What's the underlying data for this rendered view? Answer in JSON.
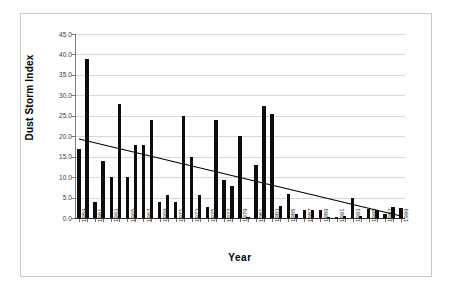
{
  "chart_data": {
    "type": "bar",
    "title": "",
    "xlabel": "Year",
    "ylabel": "Dust Storm Index",
    "ylim": [
      0,
      45
    ],
    "ytick_step": 5,
    "ytick_labels": [
      "0.0",
      "5.0",
      "10.0",
      "15.0",
      "20.0",
      "25.0",
      "30.0",
      "35.0",
      "40.0",
      "45.0"
    ],
    "grid": true,
    "legend": "none",
    "bar_color": "#0d0d0d",
    "categories": [
      "1959",
      "1960",
      "1961",
      "1962",
      "1963",
      "1964",
      "1965",
      "1966",
      "1967",
      "1968",
      "1969",
      "1970",
      "1971",
      "1972",
      "1973",
      "1974",
      "1975",
      "1976",
      "1977",
      "1978",
      "1979",
      "1980",
      "1981",
      "1982",
      "1983",
      "1984",
      "1985",
      "1986",
      "1987",
      "1988",
      "1989",
      "1990",
      "1991",
      "1992",
      "1993",
      "1994",
      "1995",
      "1996",
      "1997",
      "1998",
      "1999"
    ],
    "xtick_labels_shown": [
      "1959",
      "1961",
      "1963",
      "1965",
      "1967",
      "1969",
      "1971",
      "1973",
      "1975",
      "1977",
      "1979",
      "1981",
      "1983",
      "1985",
      "1987",
      "1989",
      "1991",
      "1993",
      "1995",
      "1997",
      "1999"
    ],
    "values": [
      16.8,
      39.0,
      3.9,
      13.9,
      10.0,
      28.0,
      10.0,
      17.9,
      17.9,
      24.0,
      4.0,
      5.7,
      3.8,
      25.0,
      14.9,
      5.7,
      2.8,
      24.0,
      9.2,
      7.8,
      20.0,
      0.2,
      13.0,
      27.3,
      25.4,
      3.0,
      5.9,
      1.1,
      1.9,
      1.9,
      1.9,
      0.2,
      0.0,
      0.5,
      4.9,
      0.5,
      2.1,
      1.9,
      1.1,
      2.8,
      2.5
    ],
    "series": [
      {
        "name": "Dust Storm Index",
        "type": "bar",
        "values": [
          16.8,
          39.0,
          3.9,
          13.9,
          10.0,
          28.0,
          10.0,
          17.9,
          17.9,
          24.0,
          4.0,
          5.7,
          3.8,
          25.0,
          14.9,
          5.7,
          2.8,
          24.0,
          9.2,
          7.8,
          20.0,
          0.2,
          13.0,
          27.3,
          25.4,
          3.0,
          5.9,
          1.1,
          1.9,
          1.9,
          1.9,
          0.2,
          0.0,
          0.5,
          4.9,
          0.5,
          2.1,
          1.9,
          1.1,
          2.8,
          2.5
        ]
      },
      {
        "name": "Linear trend",
        "type": "line",
        "x": [
          "1959",
          "1999"
        ],
        "values": [
          19.3,
          0.5
        ],
        "color": "#000000"
      }
    ],
    "annotations": []
  }
}
